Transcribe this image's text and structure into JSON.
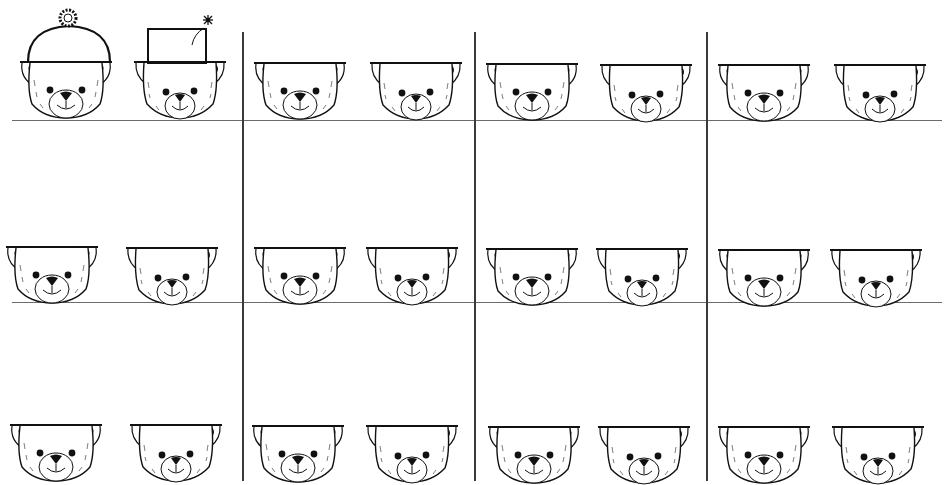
{
  "worksheet": {
    "ink_color": "#111111",
    "line_color": "#6b6b6b",
    "background": "#ffffff",
    "horizontal_lines": [
      {
        "y": 120,
        "x1": 12,
        "x2": 942
      },
      {
        "y": 302,
        "x1": 12,
        "x2": 942
      }
    ],
    "vertical_lines": [
      {
        "x": 242,
        "y1": 32,
        "y2": 481
      },
      {
        "x": 474,
        "y1": 32,
        "y2": 481
      },
      {
        "x": 706,
        "y1": 32,
        "y2": 481
      }
    ],
    "bears": [
      {
        "row": 1,
        "col": 1,
        "x": 18,
        "y": 60,
        "hat": "pompom-beanie",
        "variant": "a"
      },
      {
        "row": 1,
        "col": 2,
        "x": 132,
        "y": 60,
        "hat": "top-hat-with-flower",
        "variant": "b"
      },
      {
        "row": 1,
        "col": 3,
        "x": 252,
        "y": 61,
        "hat": "none",
        "variant": "a"
      },
      {
        "row": 1,
        "col": 4,
        "x": 368,
        "y": 61,
        "hat": "none",
        "variant": "b"
      },
      {
        "row": 1,
        "col": 5,
        "x": 484,
        "y": 62,
        "hat": "none",
        "variant": "a"
      },
      {
        "row": 1,
        "col": 6,
        "x": 598,
        "y": 63,
        "hat": "none",
        "variant": "b"
      },
      {
        "row": 1,
        "col": 7,
        "x": 716,
        "y": 63,
        "hat": "none",
        "variant": "a"
      },
      {
        "row": 1,
        "col": 8,
        "x": 832,
        "y": 63,
        "hat": "none",
        "variant": "b"
      },
      {
        "row": 2,
        "col": 1,
        "x": 4,
        "y": 245,
        "hat": "none",
        "variant": "a"
      },
      {
        "row": 2,
        "col": 2,
        "x": 124,
        "y": 246,
        "hat": "none",
        "variant": "b"
      },
      {
        "row": 2,
        "col": 3,
        "x": 252,
        "y": 246,
        "hat": "none",
        "variant": "a"
      },
      {
        "row": 2,
        "col": 4,
        "x": 364,
        "y": 246,
        "hat": "none",
        "variant": "b"
      },
      {
        "row": 2,
        "col": 5,
        "x": 484,
        "y": 247,
        "hat": "none",
        "variant": "a"
      },
      {
        "row": 2,
        "col": 6,
        "x": 594,
        "y": 247,
        "hat": "none",
        "variant": "b"
      },
      {
        "row": 2,
        "col": 7,
        "x": 716,
        "y": 248,
        "hat": "none",
        "variant": "a"
      },
      {
        "row": 2,
        "col": 8,
        "x": 828,
        "y": 248,
        "hat": "none",
        "variant": "b"
      },
      {
        "row": 3,
        "col": 1,
        "x": 8,
        "y": 423,
        "hat": "none",
        "variant": "a"
      },
      {
        "row": 3,
        "col": 2,
        "x": 128,
        "y": 423,
        "hat": "none",
        "variant": "b"
      },
      {
        "row": 3,
        "col": 3,
        "x": 250,
        "y": 424,
        "hat": "none",
        "variant": "a"
      },
      {
        "row": 3,
        "col": 4,
        "x": 364,
        "y": 424,
        "hat": "none",
        "variant": "b"
      },
      {
        "row": 3,
        "col": 5,
        "x": 486,
        "y": 425,
        "hat": "none",
        "variant": "a"
      },
      {
        "row": 3,
        "col": 6,
        "x": 596,
        "y": 425,
        "hat": "none",
        "variant": "b"
      },
      {
        "row": 3,
        "col": 7,
        "x": 716,
        "y": 425,
        "hat": "none",
        "variant": "a"
      },
      {
        "row": 3,
        "col": 8,
        "x": 830,
        "y": 425,
        "hat": "none",
        "variant": "b"
      }
    ],
    "hats": [
      {
        "type": "pompom-beanie",
        "x": 24,
        "y": 8
      },
      {
        "type": "top-hat-with-flower",
        "x": 130,
        "y": 10
      }
    ]
  }
}
